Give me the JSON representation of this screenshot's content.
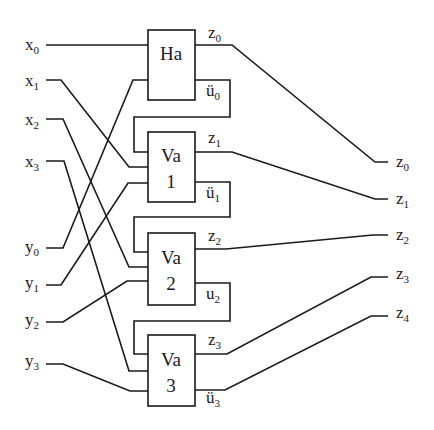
{
  "diagram": {
    "type": "4-bit parallel adder (ripple carry)",
    "blocks": [
      {
        "id": "ha",
        "line1": "Ha",
        "line2": ""
      },
      {
        "id": "va1",
        "line1": "Va",
        "line2": "1"
      },
      {
        "id": "va2",
        "line1": "Va",
        "line2": "2"
      },
      {
        "id": "va3",
        "line1": "Va",
        "line2": "3"
      }
    ],
    "inputs_x": [
      {
        "base": "x",
        "sub": "0"
      },
      {
        "base": "x",
        "sub": "1"
      },
      {
        "base": "x",
        "sub": "2"
      },
      {
        "base": "x",
        "sub": "3"
      }
    ],
    "inputs_y": [
      {
        "base": "y",
        "sub": "0"
      },
      {
        "base": "y",
        "sub": "1"
      },
      {
        "base": "y",
        "sub": "2"
      },
      {
        "base": "y",
        "sub": "3"
      }
    ],
    "block_sum_labels": [
      {
        "base": "z",
        "sub": "0"
      },
      {
        "base": "z",
        "sub": "1"
      },
      {
        "base": "z",
        "sub": "2"
      },
      {
        "base": "z",
        "sub": "3"
      }
    ],
    "carry_labels": [
      {
        "base": "ü",
        "sub": "0"
      },
      {
        "base": "ü",
        "sub": "1"
      },
      {
        "base": "u",
        "sub": "2"
      },
      {
        "base": "ü",
        "sub": "3"
      }
    ],
    "outputs": [
      {
        "base": "z",
        "sub": "0"
      },
      {
        "base": "z",
        "sub": "1"
      },
      {
        "base": "z",
        "sub": "2"
      },
      {
        "base": "z",
        "sub": "3"
      },
      {
        "base": "z",
        "sub": "4"
      }
    ]
  }
}
